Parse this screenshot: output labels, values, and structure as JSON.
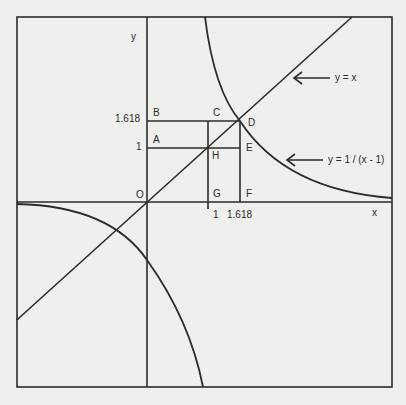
{
  "figure": {
    "type": "geometric-diagram",
    "axes": {
      "x_label": "x",
      "y_label": "y",
      "origin_label": "O"
    },
    "tick_labels": {
      "x": [
        "1",
        "1.618"
      ],
      "y": [
        "1",
        "1.618"
      ]
    },
    "points": {
      "O": "O",
      "A": "A",
      "B": "B",
      "C": "C",
      "D": "D",
      "E": "E",
      "F": "F",
      "G": "G",
      "H": "H"
    },
    "annotations": {
      "line_label": "y = x",
      "curve_label": "y = 1 / (x - 1)"
    },
    "colors": {
      "ink": "#2b2b2b",
      "paper": "#efefed"
    }
  }
}
